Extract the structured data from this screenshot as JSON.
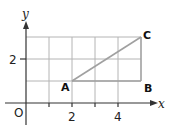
{
  "diagram": {
    "type": "coordinate-grid",
    "axes": {
      "x_label": "x",
      "y_label": "y",
      "origin_label": "O"
    },
    "x_ticks": [
      {
        "value": 2,
        "label": "2"
      },
      {
        "value": 4,
        "label": "4"
      }
    ],
    "y_ticks": [
      {
        "value": 2,
        "label": "2"
      }
    ],
    "grid": {
      "x_range": [
        0,
        5
      ],
      "y_range": [
        0,
        3
      ]
    },
    "points": [
      {
        "name": "A",
        "x": 2,
        "y": 1
      },
      {
        "name": "B",
        "x": 5,
        "y": 1
      },
      {
        "name": "C",
        "x": 5,
        "y": 3
      }
    ],
    "segments": [
      "AB",
      "BC",
      "AC"
    ],
    "colors": {
      "grid": "#b0b0b0",
      "axis": "#333333",
      "segment": "#a0a0a0"
    }
  }
}
